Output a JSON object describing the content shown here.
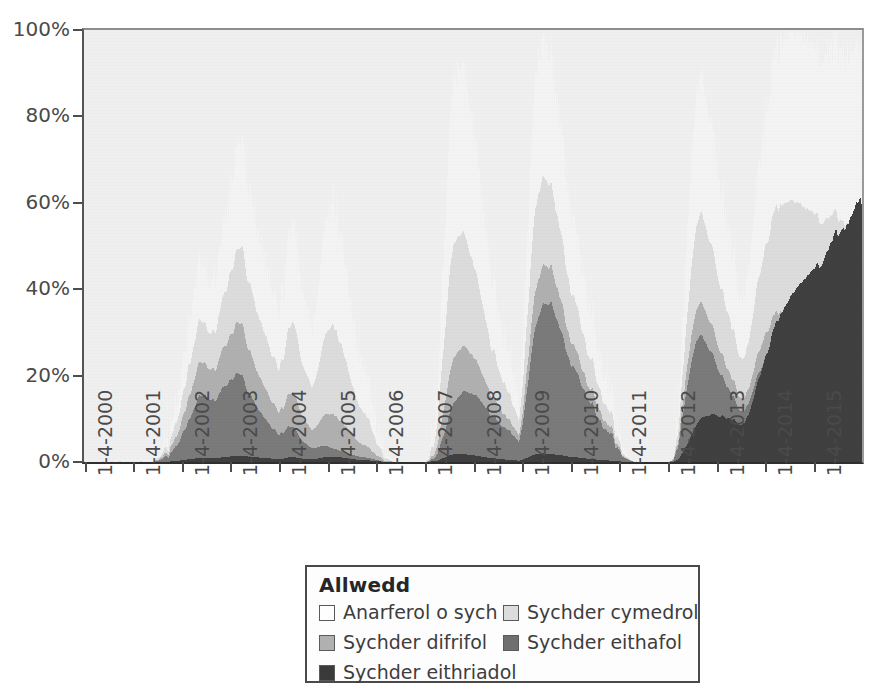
{
  "chart_data": {
    "type": "area",
    "stacked": true,
    "stack_total_percent": 100,
    "title": "",
    "xlabel": "",
    "ylabel": "",
    "ylim": [
      0,
      100
    ],
    "ytick_labels": [
      "0%",
      "20%",
      "40%",
      "60%",
      "80%",
      "100%"
    ],
    "ytick_values": [
      0,
      20,
      40,
      60,
      80,
      100
    ],
    "grid": false,
    "legend_position": "bottom-center",
    "x_tick_labels": [
      "1-4-2000",
      "1-4-2001",
      "1-4-2002",
      "1-4-2003",
      "1-4-2004",
      "1-4-2005",
      "1-4-2006",
      "1-4-2007",
      "1-4-2008",
      "1-4-2009",
      "1-4-2010",
      "1-4-2011",
      "1-4-2012",
      "1-4-2013",
      "1-4-2014",
      "1-4-2015"
    ],
    "x_range": [
      "1-4-2000",
      "1-4-2016"
    ],
    "series": [
      {
        "name": "Anarferol o sych",
        "color": "#fafafa",
        "values": [
          0,
          0,
          0,
          0,
          0,
          0,
          0,
          0,
          0,
          0,
          0,
          0,
          0,
          0,
          0,
          0,
          0,
          0,
          0,
          0,
          0,
          0,
          0,
          0,
          0,
          0,
          0,
          0,
          0,
          0,
          0,
          0,
          0,
          0,
          0,
          0,
          0,
          0,
          0,
          0,
          0,
          0,
          0,
          0,
          0,
          0,
          0,
          0,
          0,
          0,
          0,
          0,
          0,
          0,
          0,
          0,
          0,
          0,
          0,
          0,
          0,
          0,
          0,
          0,
          0,
          0,
          0,
          0,
          0,
          0,
          0,
          0,
          0,
          2,
          4,
          6,
          9,
          12,
          16,
          20,
          26,
          30,
          34,
          38,
          42,
          46,
          44,
          40,
          36,
          32,
          30,
          34,
          38,
          42,
          46,
          44,
          40,
          36,
          32,
          28,
          24,
          20,
          16,
          14,
          12,
          14,
          18,
          24,
          30,
          36,
          42,
          48,
          54,
          60,
          66,
          70,
          74,
          72,
          68,
          64,
          60,
          56,
          52,
          48,
          46,
          44,
          42,
          40,
          38,
          36,
          34,
          33,
          32,
          34,
          36,
          38,
          40,
          42,
          44,
          46,
          48,
          50,
          48,
          46,
          44,
          42,
          40,
          38,
          36,
          34,
          32,
          30,
          28,
          26,
          24,
          22,
          20,
          18,
          16,
          14,
          12,
          10,
          8,
          6,
          5,
          4,
          3,
          2,
          2,
          3,
          4,
          6,
          8,
          10,
          14,
          18,
          24,
          30,
          36,
          42,
          48,
          52,
          56,
          58,
          60,
          58,
          56,
          54,
          52,
          50,
          48,
          46,
          44,
          42,
          40,
          36,
          32,
          28,
          24,
          20,
          16,
          12,
          10,
          8,
          6,
          4,
          3,
          2,
          2,
          1,
          1,
          0,
          0,
          0,
          0,
          0,
          0,
          0,
          0,
          0,
          0,
          0,
          0,
          0,
          0,
          0,
          0,
          0,
          0,
          0,
          0,
          0,
          0,
          0,
          0,
          0,
          0,
          0,
          0,
          0,
          0,
          0,
          0,
          0,
          0,
          0,
          0,
          0,
          0,
          0,
          0,
          0,
          0,
          0,
          0,
          0,
          0,
          0,
          0,
          0,
          0,
          0,
          0,
          0,
          0,
          0,
          0,
          0,
          0,
          0,
          0,
          0,
          0,
          0,
          0,
          0,
          0,
          0,
          0,
          0,
          0,
          0,
          0,
          0,
          0,
          0,
          0,
          0,
          0,
          0,
          2,
          6,
          12,
          20,
          30,
          40,
          50,
          58,
          64,
          70,
          76,
          82,
          86,
          90,
          92,
          90,
          88,
          86,
          84,
          82,
          80,
          78,
          76,
          74,
          72,
          70,
          68,
          66,
          64,
          62,
          60,
          58,
          56,
          54,
          52,
          50,
          48,
          46,
          44,
          42,
          40,
          38,
          36,
          34,
          32,
          30,
          28,
          26,
          24,
          22,
          20,
          18,
          16,
          14,
          12,
          10,
          9,
          8,
          7,
          6,
          5,
          4,
          4,
          3,
          3,
          2,
          2,
          2,
          1,
          1,
          1,
          1,
          1,
          1,
          1,
          1,
          1,
          1,
          1,
          1,
          1,
          1,
          1,
          1,
          1,
          1,
          1,
          1,
          1,
          1,
          1,
          1,
          1,
          1
        ]
      },
      {
        "name": "Sychder cymedrol",
        "color": "#d9d9d9",
        "values": [
          0,
          0,
          0,
          0,
          0,
          0,
          0,
          0,
          0,
          0,
          0,
          0,
          0,
          0,
          0,
          0,
          0,
          0,
          0,
          0,
          0,
          0,
          0,
          0,
          0,
          0,
          0,
          0,
          0,
          0,
          0,
          0,
          0,
          0,
          0,
          0,
          0,
          0,
          0,
          0,
          0,
          0,
          0,
          0,
          0,
          0,
          0,
          0,
          0,
          0,
          0,
          0,
          0,
          0,
          0,
          0,
          0,
          0,
          0,
          0,
          0,
          0,
          0,
          0,
          0,
          0,
          0,
          1,
          2,
          3,
          4,
          5,
          6,
          8,
          10,
          12,
          14,
          16,
          18,
          20,
          22,
          24,
          26,
          28,
          30,
          32,
          30,
          28,
          26,
          24,
          22,
          24,
          26,
          28,
          30,
          28,
          26,
          24,
          22,
          20,
          18,
          16,
          14,
          12,
          10,
          12,
          14,
          18,
          22,
          26,
          30,
          34,
          38,
          42,
          44,
          46,
          48,
          46,
          44,
          42,
          40,
          38,
          36,
          34,
          32,
          30,
          28,
          26,
          24,
          22,
          20,
          19,
          18,
          20,
          22,
          24,
          26,
          28,
          30,
          32,
          34,
          36,
          34,
          32,
          30,
          28,
          26,
          24,
          22,
          20,
          18,
          17,
          16,
          15,
          14,
          13,
          12,
          11,
          10,
          9,
          8,
          7,
          6,
          5,
          4,
          3,
          3,
          2,
          2,
          2,
          3,
          4,
          5,
          6,
          8,
          10,
          14,
          18,
          22,
          26,
          30,
          34,
          38,
          40,
          42,
          40,
          38,
          36,
          34,
          32,
          30,
          28,
          26,
          24,
          22,
          20,
          18,
          16,
          14,
          12,
          10,
          8,
          7,
          6,
          5,
          4,
          3,
          2,
          2,
          1,
          1,
          0,
          0,
          0,
          0,
          0,
          0,
          0,
          0,
          0,
          0,
          0,
          0,
          0,
          0,
          0,
          0,
          0,
          0,
          0,
          0,
          0,
          0,
          0,
          0,
          0,
          0,
          0,
          0,
          0,
          0,
          0,
          0,
          0,
          0,
          0,
          0,
          0,
          0,
          0,
          0,
          0,
          0,
          0,
          0,
          0,
          0,
          0,
          0,
          0,
          0,
          0,
          0,
          0,
          0,
          0,
          0,
          0,
          0,
          0,
          0,
          0,
          0,
          0,
          0,
          0,
          0,
          0,
          0,
          0,
          0,
          0,
          0,
          0,
          0,
          0,
          0,
          0,
          0,
          0,
          1,
          4,
          8,
          14,
          22,
          30,
          38,
          46,
          52,
          58,
          64,
          70,
          74,
          78,
          80,
          78,
          76,
          74,
          72,
          70,
          68,
          66,
          64,
          62,
          60,
          58,
          56,
          54,
          52,
          50,
          48,
          46,
          44,
          42,
          40,
          38,
          36,
          34,
          32,
          30,
          28,
          26,
          24,
          22,
          20,
          18,
          17,
          16,
          15,
          14,
          13,
          12,
          11,
          10,
          9,
          8,
          7,
          7,
          6,
          6,
          5,
          5,
          4,
          4,
          3,
          3,
          2,
          2,
          2,
          1,
          1,
          1,
          1,
          1,
          1,
          1,
          1,
          1,
          1,
          1,
          1,
          1,
          1,
          1,
          1,
          1,
          1,
          1,
          1,
          1,
          1,
          1,
          1,
          1
        ]
      }
    ],
    "categories_note": "Monthly percent-area stacked by drought severity, 2000-2015",
    "gray_levels": {
      "plot_background": "#f0f0f0",
      "abnormally_dry": "#f2f2f2",
      "moderate": "#d8d8d8",
      "severe": "#b4b4b4",
      "extreme": "#7f7f7f",
      "exceptional": "#4a4a4a",
      "axis": "#4d4d4d",
      "text": "#3d3d3d"
    },
    "stack_levels": [
      {
        "key": "abnormally_dry",
        "label": "Anarferol o sych",
        "color": "#f4f4f4",
        "order": 5
      },
      {
        "key": "moderate",
        "label": "Sychder cymedrol",
        "color": "#dcdcdc",
        "order": 4
      },
      {
        "key": "severe",
        "label": "Sychder difrifol",
        "color": "#b0b0b0",
        "order": 3
      },
      {
        "key": "extreme",
        "label": "Sychder eithafol",
        "color": "#7a7a7a",
        "order": 2
      },
      {
        "key": "exceptional",
        "label": "Sychder eithriadol",
        "color": "#3f3f3f",
        "order": 1
      }
    ],
    "envelope_percent": {
      "note": "Cumulative top-of-stack percentages sampled at 192 monthly steps (2000-01 .. 2015-12) for each severity tier, read from the plot.",
      "total": [
        0,
        0,
        0,
        0,
        0,
        0,
        0,
        0,
        0,
        0,
        0,
        0,
        0,
        0,
        0,
        0,
        0,
        0,
        1,
        2,
        3,
        6,
        10,
        14,
        20,
        26,
        33,
        39,
        45,
        47,
        43,
        38,
        42,
        47,
        52,
        58,
        64,
        70,
        74,
        72,
        66,
        60,
        56,
        52,
        48,
        44,
        40,
        36,
        34,
        40,
        48,
        56,
        52,
        44,
        38,
        32,
        28,
        36,
        44,
        52,
        58,
        61,
        57,
        50,
        44,
        38,
        33,
        28,
        24,
        20,
        16,
        12,
        8,
        4,
        2,
        1,
        0,
        0,
        0,
        0,
        0,
        0,
        0,
        0,
        0,
        2,
        8,
        20,
        40,
        62,
        80,
        88,
        92,
        90,
        86,
        80,
        74,
        66,
        58,
        50,
        44,
        38,
        34,
        30,
        26,
        22,
        18,
        14,
        30,
        55,
        75,
        88,
        94,
        98,
        96,
        92,
        86,
        78,
        70,
        62,
        56,
        50,
        44,
        40,
        36,
        32,
        28,
        24,
        20,
        16,
        12,
        8,
        4,
        2,
        1,
        0,
        0,
        0,
        0,
        0,
        0,
        0,
        0,
        0,
        0,
        2,
        12,
        30,
        50,
        68,
        80,
        86,
        88,
        84,
        78,
        72,
        66,
        60,
        54,
        48,
        44,
        40,
        38,
        42,
        50,
        60,
        70,
        78,
        84,
        90,
        94,
        97,
        99,
        100,
        100,
        99,
        98,
        97,
        96,
        95,
        94,
        93,
        94,
        95,
        96,
        95,
        94,
        93,
        94,
        95,
        96,
        95
      ]
    }
  },
  "axes": {
    "y": {
      "ticks": [
        {
          "label": "100%",
          "value": 100
        },
        {
          "label": "80%",
          "value": 80
        },
        {
          "label": "60%",
          "value": 60
        },
        {
          "label": "40%",
          "value": 40
        },
        {
          "label": "20%",
          "value": 20
        },
        {
          "label": "0%",
          "value": 0
        }
      ]
    },
    "x": {
      "ticks": [
        {
          "label": "1-4-2000"
        },
        {
          "label": "1-4-2001"
        },
        {
          "label": "1-4-2002"
        },
        {
          "label": "1-4-2003"
        },
        {
          "label": "1-4-2004"
        },
        {
          "label": "1-4-2005"
        },
        {
          "label": "1-4-2006"
        },
        {
          "label": "1-4-2007"
        },
        {
          "label": "1-4-2008"
        },
        {
          "label": "1-4-2009"
        },
        {
          "label": "1-4-2010"
        },
        {
          "label": "1-4-2011"
        },
        {
          "label": "1-4-2012"
        },
        {
          "label": "1-4-2013"
        },
        {
          "label": "1-4-2014"
        },
        {
          "label": "1-4-2015"
        }
      ]
    }
  },
  "legend": {
    "title": "Allwedd",
    "items": [
      {
        "label": "Anarferol o sych",
        "color": "#fefefe",
        "col": 0,
        "row": 0
      },
      {
        "label": "Sychder cymedrol",
        "color": "#dcdcdc",
        "col": 1,
        "row": 0
      },
      {
        "label": "Sychder difrifol",
        "color": "#b0b0b0",
        "col": 0,
        "row": 1
      },
      {
        "label": "Sychder eithafol",
        "color": "#6f6f6f",
        "col": 1,
        "row": 1
      },
      {
        "label": "Sychder eithriadol",
        "color": "#3a3a3a",
        "col": 0,
        "row": 2
      }
    ]
  }
}
